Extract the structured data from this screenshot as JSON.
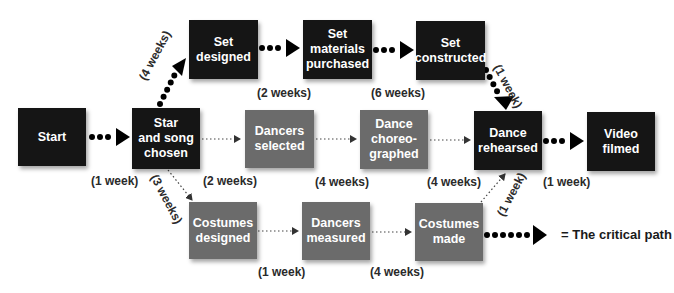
{
  "diagram": {
    "colors": {
      "critical_box": "#151515",
      "noncritical_box": "#6b6b6b",
      "text": "#ffffff",
      "label": "#2a2a2a"
    },
    "nodes": {
      "start": "Start",
      "star_song": "Star\nand song\nchosen",
      "set_designed": "Set\ndesigned",
      "set_materials": "Set\nmaterials\npurchased",
      "set_constructed": "Set\nconstructed",
      "dancers_selected": "Dancers\nselected",
      "dance_choreographed": "Dance\nchoreo-\ngraphed",
      "dance_rehearsed": "Dance\nrehearsed",
      "video_filmed": "Video\nfilmed",
      "costumes_designed": "Costumes\ndesigned",
      "dancers_measured": "Dancers\nmeasured",
      "costumes_made": "Costumes\nmade"
    },
    "durations": {
      "start_to_star": "(1 week)",
      "star_to_set_designed": "(4 weeks)",
      "set_designed_to_materials": "(2 weeks)",
      "materials_to_constructed": "(6 weeks)",
      "constructed_to_rehearsed": "(1 week)",
      "star_to_dancers_selected": "(2 weeks)",
      "selected_to_choreographed": "(4 weeks)",
      "choreographed_to_rehearsed": "(4 weeks)",
      "rehearsed_to_filmed": "(1 week)",
      "star_to_costumes_designed": "(3 weeks)",
      "costumes_designed_to_measured": "(1 week)",
      "measured_to_costumes_made": "(4 weeks)",
      "costumes_made_to_rehearsed": "(1 week)"
    },
    "legend": {
      "label": "= The critical path"
    }
  }
}
